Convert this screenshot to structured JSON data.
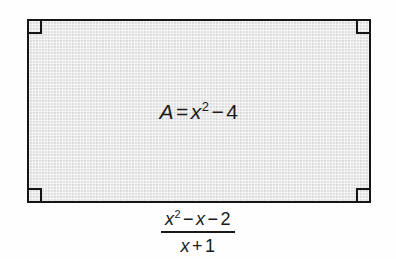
{
  "figure": {
    "type": "rectangle-area-diagram",
    "fill_color": "#e3e3e3",
    "stroke_color": "#151515",
    "background_color": "#fefefe",
    "corner_markers": [
      {
        "position": "top-left",
        "label": "right-angle"
      },
      {
        "position": "top-right",
        "label": "right-angle"
      },
      {
        "position": "bottom-left",
        "label": "right-angle"
      },
      {
        "position": "bottom-right",
        "label": "right-angle"
      }
    ],
    "area_label": {
      "variable": "A",
      "equals": "=",
      "term_base": "x",
      "term_exponent": "2",
      "minus": "−",
      "constant": "4",
      "plain_text": "A = x² − 4"
    }
  },
  "fraction": {
    "numerator": {
      "base": "x",
      "exponent": "2",
      "minus_1": "−",
      "term": "x",
      "minus_2": "−",
      "constant": "2",
      "plain_text": "x² − x − 2"
    },
    "denominator": {
      "term": "x",
      "plus": "+",
      "constant": "1",
      "plain_text": "x + 1"
    },
    "plain_text": "(x² − x − 2) / (x + 1)"
  }
}
